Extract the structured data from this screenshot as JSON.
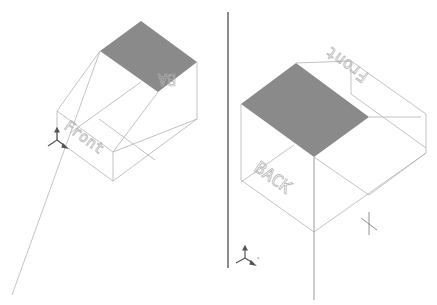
{
  "viewports": {
    "left": {
      "label_front": "Front",
      "label_back": "BA",
      "shaded_color": "#8a8a8a",
      "triad": "coordinate-triad"
    },
    "right": {
      "label_front": "Front",
      "label_back": "BACK",
      "shaded_color": "#8a8a8a",
      "triad": "coordinate-triad",
      "triad_axes": [
        "Y",
        "X",
        "Z"
      ]
    }
  },
  "divider_color": "#404040"
}
